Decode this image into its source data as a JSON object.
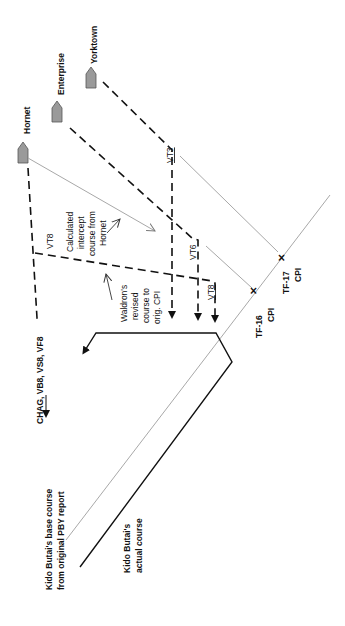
{
  "carriers": [
    {
      "name": "Hornet"
    },
    {
      "name": "Enterprise"
    },
    {
      "name": "Yorktown"
    }
  ],
  "squadron_labels": {
    "vt3": "VT3",
    "vt6": "VT6",
    "vt8_upper": "VT8",
    "vt8_lower": "VT8",
    "hornet_group": "CHAG, VB8, VS8, VF8"
  },
  "annotations": {
    "intercept": [
      "Calculated",
      "intercept",
      "course from",
      "Hornet"
    ],
    "waldron": [
      "Waldron's",
      "revised",
      "course to",
      "orig. CPI"
    ],
    "base_course": [
      "Kido Butai's base course",
      "from original PBY report"
    ],
    "actual_course": [
      "Kido Butai's",
      "actual course"
    ]
  },
  "cpi_markers": [
    {
      "name": "TF-16",
      "sub": "CPI"
    },
    {
      "name": "TF-17",
      "sub": "CPI"
    }
  ],
  "colors": {
    "ship_fill": "#9a9a9a",
    "ink": "#111111",
    "gray_line": "#9c9c9c"
  }
}
